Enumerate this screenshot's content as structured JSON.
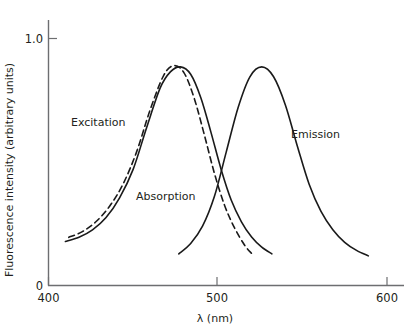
{
  "chart_data": {
    "type": "line",
    "title": "",
    "xlabel": "λ (nm)",
    "ylabel": "Fluorescence intensity (arbitrary units)",
    "xlim": [
      400,
      600
    ],
    "ylim": [
      0,
      1.12
    ],
    "grid": false,
    "legend_position": "inline-annotations",
    "xticks": [
      "400",
      "500",
      "600"
    ],
    "xtick_values": [
      400,
      500,
      600
    ],
    "yticks": [
      "0",
      "1.0"
    ],
    "ytick_values": [
      0,
      1.0
    ],
    "annotations": [
      {
        "text": "Excitation",
        "x": 432,
        "y": 0.62
      },
      {
        "text": "Absorption",
        "x": 470,
        "y": 0.38
      },
      {
        "text": "Emission",
        "x": 567,
        "y": 0.6
      }
    ],
    "series": [
      {
        "name": "Excitation",
        "style": "solid",
        "peak_x": 478,
        "peak_y": 0.885,
        "x": [
          410,
          418,
          426,
          434,
          442,
          450,
          458,
          466,
          472,
          478,
          484,
          490,
          496,
          502,
          508,
          514,
          520,
          526,
          532
        ],
        "y": [
          0.178,
          0.195,
          0.225,
          0.275,
          0.355,
          0.47,
          0.64,
          0.8,
          0.865,
          0.885,
          0.855,
          0.76,
          0.62,
          0.47,
          0.345,
          0.258,
          0.196,
          0.155,
          0.128
        ]
      },
      {
        "name": "Absorption",
        "style": "dashed",
        "peak_x": 476,
        "peak_y": 0.89,
        "x": [
          412,
          420,
          428,
          436,
          444,
          452,
          460,
          468,
          474,
          480,
          486,
          492,
          498,
          504,
          510,
          516,
          520
        ],
        "y": [
          0.195,
          0.218,
          0.258,
          0.32,
          0.41,
          0.54,
          0.71,
          0.85,
          0.89,
          0.862,
          0.76,
          0.612,
          0.455,
          0.325,
          0.232,
          0.162,
          0.13
        ]
      },
      {
        "name": "Emission",
        "style": "solid",
        "peak_x": 526,
        "peak_y": 0.885,
        "x": [
          477,
          484,
          491,
          498,
          505,
          512,
          519,
          526,
          533,
          540,
          547,
          554,
          561,
          568,
          575,
          582,
          589
        ],
        "y": [
          0.128,
          0.17,
          0.24,
          0.36,
          0.54,
          0.72,
          0.845,
          0.885,
          0.845,
          0.73,
          0.565,
          0.41,
          0.3,
          0.226,
          0.175,
          0.142,
          0.12
        ]
      }
    ]
  },
  "axes": {
    "y_axis_label": "Fluorescence intensity (arbitrary units)",
    "x_axis_label": "λ (nm)",
    "y_tick_top": "1.0",
    "y_tick_bottom": "0",
    "x_tick_left": "400",
    "x_tick_mid": "500",
    "x_tick_right": "600"
  },
  "labels": {
    "excitation": "Excitation",
    "absorption": "Absorption",
    "emission": "Emission"
  },
  "colors": {
    "curve": "#1a1a1a",
    "axis": "#6d6e71",
    "text": "#231f20",
    "background": "#ffffff"
  }
}
